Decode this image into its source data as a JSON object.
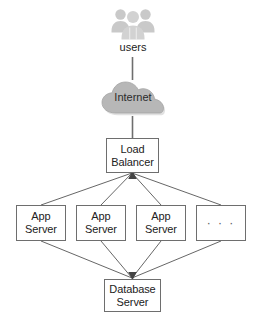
{
  "diagram": {
    "background_color": "#ffffff",
    "stroke_color": "#6e6e6e",
    "icon_fill_color": "#c9c9c9",
    "cloud_fill_color": "#b5b5b5",
    "text_color": "#222222"
  },
  "nodes": {
    "users": {
      "label": "users",
      "icon": "users-group-icon"
    },
    "internet": {
      "label": "Internet",
      "icon": "cloud-icon"
    },
    "load_balancer": {
      "line_1": "Load",
      "line_2": "Balancer"
    },
    "app_servers": [
      {
        "line_1": "App",
        "line_2": "Server"
      },
      {
        "line_1": "App",
        "line_2": "Server"
      },
      {
        "line_1": "App",
        "line_2": "Server"
      },
      {
        "line_1": "",
        "line_2": "· · ·"
      }
    ],
    "database": {
      "line_1": "Database",
      "line_2": "Server"
    }
  },
  "edges": {
    "users_to_internet": "line",
    "internet_to_load_balancer": "line",
    "load_balancer_to_app_servers": "arrows-up-to-load-balancer",
    "app_servers_to_database": "arrows-down-to-database"
  }
}
